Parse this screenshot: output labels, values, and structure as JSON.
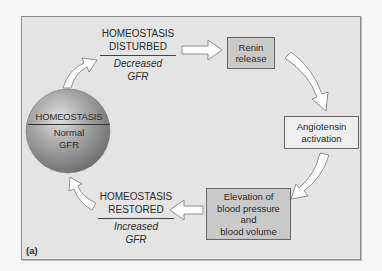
{
  "diagram": {
    "figure_label": "(a)",
    "center_node": {
      "title": "HOMEOSTASIS",
      "subtitle_line1": "Normal",
      "subtitle_line2": "GFR"
    },
    "disturbed": {
      "line1": "HOMEOSTASIS",
      "line2": "DISTURBED",
      "sub1": "Decreased",
      "sub2": "GFR"
    },
    "restored": {
      "line1": "HOMEOSTASIS",
      "line2": "RESTORED",
      "sub1": "Increased",
      "sub2": "GFR"
    },
    "steps": [
      {
        "label": "Renin\nrelease"
      },
      {
        "label": "Angiotensin\nactivation"
      },
      {
        "label": "Elevation of\nblood pressure\nand\nblood volume"
      }
    ],
    "colors": {
      "background": "#f6f6f6",
      "panel": "#e4e4e4",
      "box_dark": "#c9c9c9",
      "box_light": "#eeeeee",
      "sphere": "#8f8f8f"
    }
  }
}
